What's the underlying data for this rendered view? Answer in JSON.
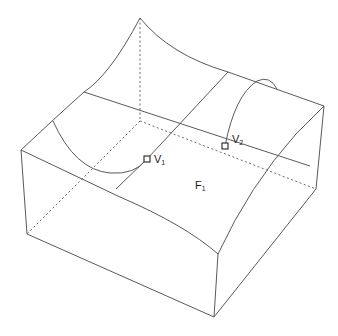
{
  "figure": {
    "type": "3D solid wireframe diagram",
    "labels": {
      "v1": {
        "main": "V",
        "sub": "1"
      },
      "v2": {
        "main": "V",
        "sub": "2"
      },
      "f1": {
        "main": "F",
        "sub": "1"
      }
    },
    "colors": {
      "edge": "#5a5a5a",
      "hidden_edge": "#6a6a6a",
      "marker": "#222222",
      "background": "#ffffff"
    }
  }
}
